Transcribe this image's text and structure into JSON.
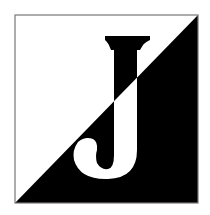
{
  "logo": {
    "letter": "J",
    "colors": {
      "light": "#ffffff",
      "dark": "#000000",
      "border": "#777777"
    }
  }
}
